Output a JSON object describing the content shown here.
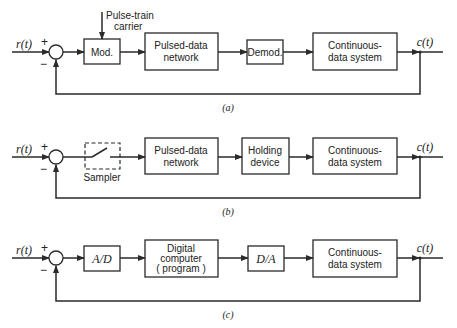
{
  "diagrams": [
    {
      "caption": "(a)",
      "input": "r(t)",
      "output": "c(t)",
      "plus": "+",
      "minus": "−",
      "carrier_label": [
        "Pulse-train",
        "carrier"
      ],
      "blocks": [
        {
          "lines": [
            "Mod."
          ]
        },
        {
          "lines": [
            "Pulsed-data",
            "network"
          ]
        },
        {
          "lines": [
            "Demod."
          ]
        },
        {
          "lines": [
            "Continuous-",
            "data system"
          ]
        }
      ]
    },
    {
      "caption": "(b)",
      "input": "r(t)",
      "output": "c(t)",
      "plus": "+",
      "minus": "−",
      "sampler_label": "Sampler",
      "blocks": [
        {
          "lines": [
            "Pulsed-data",
            "network"
          ]
        },
        {
          "lines": [
            "Holding",
            "device"
          ]
        },
        {
          "lines": [
            "Continuous-",
            "data system"
          ]
        }
      ]
    },
    {
      "caption": "(c)",
      "input": "r(t)",
      "output": "c(t)",
      "plus": "+",
      "minus": "−",
      "blocks": [
        {
          "lines": [
            "A/D"
          ]
        },
        {
          "lines": [
            "Digital",
            "computer",
            "( program )"
          ]
        },
        {
          "lines": [
            "D/A"
          ]
        },
        {
          "lines": [
            "Continuous-",
            "data system"
          ]
        }
      ]
    }
  ]
}
